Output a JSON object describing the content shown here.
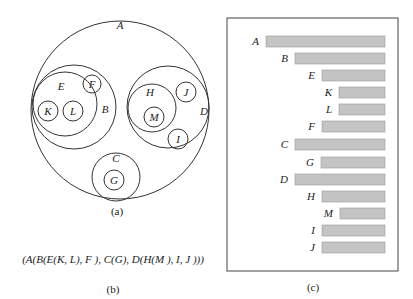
{
  "panel_a": {
    "caption": "(a)",
    "circles": [
      {
        "id": "A",
        "cx": 120,
        "cy": 110,
        "r": 89,
        "label": "A",
        "lx": 120,
        "ly": 29
      },
      {
        "id": "B",
        "cx": 74,
        "cy": 107,
        "r": 42,
        "label": "B",
        "lx": 105,
        "ly": 113
      },
      {
        "id": "E",
        "cx": 65,
        "cy": 104,
        "r": 32,
        "label": "E",
        "lx": 61,
        "ly": 90
      },
      {
        "id": "F",
        "cx": 92,
        "cy": 84,
        "r": 9,
        "label": "F",
        "lx": 92,
        "ly": 88
      },
      {
        "id": "K",
        "cx": 48,
        "cy": 111,
        "r": 10,
        "label": "K",
        "lx": 48,
        "ly": 115
      },
      {
        "id": "L",
        "cx": 73,
        "cy": 111,
        "r": 10,
        "label": "L",
        "lx": 73,
        "ly": 115
      },
      {
        "id": "D",
        "cx": 168,
        "cy": 107,
        "r": 41,
        "label": "D",
        "lx": 204,
        "ly": 115
      },
      {
        "id": "H",
        "cx": 152,
        "cy": 108,
        "r": 24,
        "label": "H",
        "lx": 150,
        "ly": 96
      },
      {
        "id": "M",
        "cx": 154,
        "cy": 117,
        "r": 10,
        "label": "M",
        "lx": 154,
        "ly": 121
      },
      {
        "id": "J",
        "cx": 186,
        "cy": 92,
        "r": 10,
        "label": "J",
        "lx": 186,
        "ly": 96
      },
      {
        "id": "I",
        "cx": 178,
        "cy": 139,
        "r": 10,
        "label": "I",
        "lx": 178,
        "ly": 143
      },
      {
        "id": "C",
        "cx": 116,
        "cy": 177,
        "r": 24,
        "label": "C",
        "lx": 116,
        "ly": 162
      },
      {
        "id": "G",
        "cx": 114,
        "cy": 180,
        "r": 10,
        "label": "G",
        "lx": 114,
        "ly": 184
      }
    ]
  },
  "panel_b": {
    "expression": "(A(B(E(K, L), F ), C(G), D(H(M ), I, J )))",
    "caption": "(b)"
  },
  "panel_c": {
    "caption": "(c)",
    "box": {
      "x": 227,
      "y": 18,
      "w": 171,
      "h": 253
    },
    "bar_color": "#c4c4c4",
    "bar_border": "#9a9a9a",
    "bar_right": 385,
    "rows": [
      {
        "label": "A",
        "x": 266,
        "y": 36
      },
      {
        "label": "B",
        "x": 295,
        "y": 53
      },
      {
        "label": "E",
        "x": 322,
        "y": 70
      },
      {
        "label": "K",
        "x": 339,
        "y": 87
      },
      {
        "label": "L",
        "x": 339,
        "y": 104
      },
      {
        "label": "F",
        "x": 322,
        "y": 121
      },
      {
        "label": "C",
        "x": 295,
        "y": 139
      },
      {
        "label": "G",
        "x": 321,
        "y": 157
      },
      {
        "label": "D",
        "x": 295,
        "y": 174
      },
      {
        "label": "H",
        "x": 322,
        "y": 191
      },
      {
        "label": "M",
        "x": 340,
        "y": 208
      },
      {
        "label": "I",
        "x": 322,
        "y": 225
      },
      {
        "label": "J",
        "x": 322,
        "y": 242
      }
    ]
  }
}
